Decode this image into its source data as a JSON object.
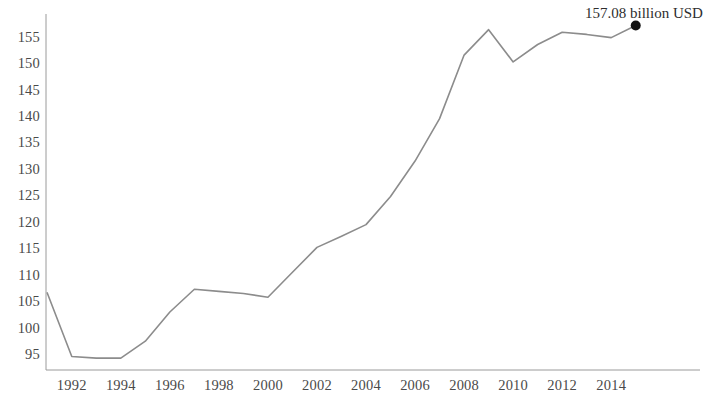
{
  "chart_data": {
    "type": "line",
    "title": "",
    "subtitle": "",
    "xlabel": "",
    "ylabel": "",
    "grid": false,
    "legend": null,
    "legend_position": "none",
    "x": [
      1991,
      1992,
      1993,
      1994,
      1995,
      1996,
      1997,
      1998,
      1999,
      2000,
      2001,
      2002,
      2003,
      2004,
      2005,
      2006,
      2007,
      2008,
      2009,
      2010,
      2011,
      2012,
      2013,
      2014,
      2015
    ],
    "values": [
      106.6,
      94.6,
      94.3,
      94.3,
      97.5,
      103.0,
      107.3,
      106.9,
      106.5,
      105.8,
      110.5,
      115.2,
      117.3,
      119.5,
      124.8,
      131.5,
      139.5,
      151.5,
      156.3,
      150.2,
      153.5,
      155.8,
      155.4,
      154.8,
      157.08
    ],
    "series": [
      {
        "name": "billion USD",
        "color": "#8c8c8c",
        "values": [
          106.6,
          94.6,
          94.3,
          94.3,
          97.5,
          103.0,
          107.3,
          106.9,
          106.5,
          105.8,
          110.5,
          115.2,
          117.3,
          119.5,
          124.8,
          131.5,
          139.5,
          151.5,
          156.3,
          150.2,
          153.5,
          155.8,
          155.4,
          154.8,
          157.08
        ]
      }
    ],
    "xlim": [
      1990.5,
      2015.5
    ],
    "ylim": [
      93.0,
      158.5
    ],
    "x_ticks": [
      1992,
      1994,
      1996,
      1998,
      2000,
      2002,
      2004,
      2006,
      2008,
      2010,
      2012,
      2014
    ],
    "x_tick_labels": [
      "1992",
      "1994",
      "1996",
      "1998",
      "2000",
      "2002",
      "2004",
      "2006",
      "2008",
      "2010",
      "2012",
      "2014"
    ],
    "y_ticks": [
      95,
      100,
      105,
      110,
      115,
      120,
      125,
      130,
      135,
      140,
      145,
      150,
      155
    ],
    "y_tick_labels": [
      "95",
      "100",
      "105",
      "110",
      "115",
      "120",
      "125",
      "130",
      "135",
      "140",
      "145",
      "150",
      "155"
    ],
    "annotations": [
      {
        "name": "end-point-label",
        "text": "157.08 billion USD",
        "x": 2015,
        "y": 157.08,
        "marker": "dot",
        "marker_color": "#111111"
      }
    ],
    "line_color": "#8c8c8c",
    "line_width": 1.6,
    "axis_color": "#8c8c8c"
  }
}
